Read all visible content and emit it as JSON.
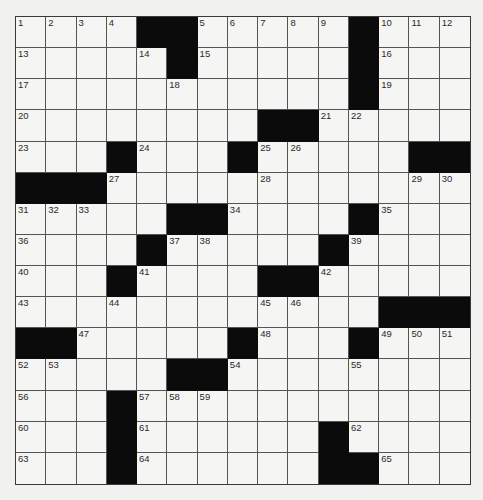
{
  "puzzle": {
    "size": {
      "rows": 15,
      "cols": 15
    },
    "colors": {
      "background": "#f1f1f0",
      "cell": "#f5f5f4",
      "block": "#0b0b0b",
      "line": "#555555",
      "number": "#2a2a2a"
    },
    "rows": [
      "....##.....#...",
      ".....#.....#...",
      "...........#...",
      "........##.....",
      "...#...#.....##",
      "###............",
      ".....##....#...",
      "....#.....#....",
      "...#....##.....",
      "............###",
      "##.....#...#...",
      ".....##........",
      "...#...........",
      "...#......#....",
      "...#......##..."
    ],
    "numbers": [
      {
        "r": 0,
        "c": 0,
        "n": "1"
      },
      {
        "r": 0,
        "c": 1,
        "n": "2"
      },
      {
        "r": 0,
        "c": 2,
        "n": "3"
      },
      {
        "r": 0,
        "c": 3,
        "n": "4"
      },
      {
        "r": 0,
        "c": 6,
        "n": "5"
      },
      {
        "r": 0,
        "c": 7,
        "n": "6"
      },
      {
        "r": 0,
        "c": 8,
        "n": "7"
      },
      {
        "r": 0,
        "c": 9,
        "n": "8"
      },
      {
        "r": 0,
        "c": 10,
        "n": "9"
      },
      {
        "r": 0,
        "c": 12,
        "n": "10"
      },
      {
        "r": 0,
        "c": 13,
        "n": "11"
      },
      {
        "r": 0,
        "c": 14,
        "n": "12"
      },
      {
        "r": 1,
        "c": 0,
        "n": "13"
      },
      {
        "r": 1,
        "c": 4,
        "n": "14"
      },
      {
        "r": 1,
        "c": 6,
        "n": "15"
      },
      {
        "r": 1,
        "c": 12,
        "n": "16"
      },
      {
        "r": 2,
        "c": 0,
        "n": "17"
      },
      {
        "r": 2,
        "c": 5,
        "n": "18"
      },
      {
        "r": 2,
        "c": 12,
        "n": "19"
      },
      {
        "r": 3,
        "c": 0,
        "n": "20"
      },
      {
        "r": 3,
        "c": 10,
        "n": "21"
      },
      {
        "r": 3,
        "c": 11,
        "n": "22"
      },
      {
        "r": 4,
        "c": 0,
        "n": "23"
      },
      {
        "r": 4,
        "c": 4,
        "n": "24"
      },
      {
        "r": 4,
        "c": 8,
        "n": "25"
      },
      {
        "r": 4,
        "c": 9,
        "n": "26"
      },
      {
        "r": 5,
        "c": 3,
        "n": "27"
      },
      {
        "r": 5,
        "c": 8,
        "n": "28"
      },
      {
        "r": 5,
        "c": 13,
        "n": "29"
      },
      {
        "r": 5,
        "c": 14,
        "n": "30"
      },
      {
        "r": 6,
        "c": 0,
        "n": "31"
      },
      {
        "r": 6,
        "c": 1,
        "n": "32"
      },
      {
        "r": 6,
        "c": 2,
        "n": "33"
      },
      {
        "r": 6,
        "c": 7,
        "n": "34"
      },
      {
        "r": 6,
        "c": 12,
        "n": "35"
      },
      {
        "r": 7,
        "c": 0,
        "n": "36"
      },
      {
        "r": 7,
        "c": 5,
        "n": "37"
      },
      {
        "r": 7,
        "c": 6,
        "n": "38"
      },
      {
        "r": 7,
        "c": 11,
        "n": "39"
      },
      {
        "r": 8,
        "c": 0,
        "n": "40"
      },
      {
        "r": 8,
        "c": 4,
        "n": "41"
      },
      {
        "r": 8,
        "c": 10,
        "n": "42"
      },
      {
        "r": 9,
        "c": 0,
        "n": "43"
      },
      {
        "r": 9,
        "c": 3,
        "n": "44"
      },
      {
        "r": 9,
        "c": 8,
        "n": "45"
      },
      {
        "r": 9,
        "c": 9,
        "n": "46"
      },
      {
        "r": 10,
        "c": 2,
        "n": "47"
      },
      {
        "r": 10,
        "c": 8,
        "n": "48"
      },
      {
        "r": 10,
        "c": 12,
        "n": "49"
      },
      {
        "r": 10,
        "c": 13,
        "n": "50"
      },
      {
        "r": 10,
        "c": 14,
        "n": "51"
      },
      {
        "r": 11,
        "c": 0,
        "n": "52"
      },
      {
        "r": 11,
        "c": 1,
        "n": "53"
      },
      {
        "r": 11,
        "c": 7,
        "n": "54"
      },
      {
        "r": 11,
        "c": 11,
        "n": "55"
      },
      {
        "r": 12,
        "c": 0,
        "n": "56"
      },
      {
        "r": 12,
        "c": 4,
        "n": "57"
      },
      {
        "r": 12,
        "c": 5,
        "n": "58"
      },
      {
        "r": 12,
        "c": 6,
        "n": "59"
      },
      {
        "r": 13,
        "c": 0,
        "n": "60"
      },
      {
        "r": 13,
        "c": 4,
        "n": "61"
      },
      {
        "r": 13,
        "c": 11,
        "n": "62"
      },
      {
        "r": 14,
        "c": 0,
        "n": "63"
      },
      {
        "r": 14,
        "c": 4,
        "n": "64"
      },
      {
        "r": 14,
        "c": 12,
        "n": "65"
      }
    ]
  }
}
